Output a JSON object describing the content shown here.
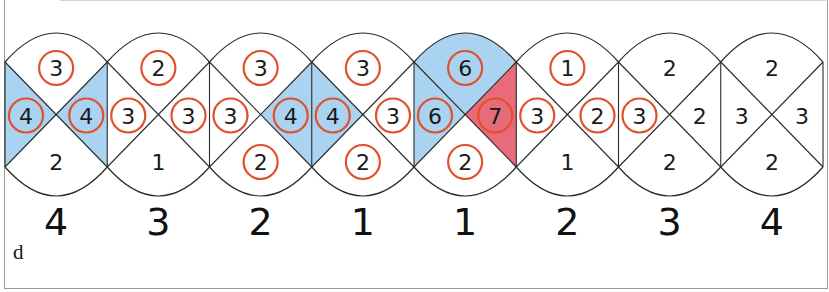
{
  "figure_label": "d",
  "colors": {
    "line": "#2a2a2a",
    "blue_fill": "#a9d3f0",
    "red_fill": "#e86b7a",
    "circle_stroke": "#e0502a",
    "text": "#1a1a1a"
  },
  "cells": [
    {
      "top": {
        "v": "3",
        "c": true
      },
      "left": {
        "v": "4",
        "c": true
      },
      "right": {
        "v": "4",
        "c": true
      },
      "bottom": {
        "v": "2",
        "c": false
      },
      "fill": {
        "left": "blue",
        "right": "blue"
      }
    },
    {
      "top": {
        "v": "2",
        "c": true
      },
      "left": {
        "v": "3",
        "c": true
      },
      "right": {
        "v": "3",
        "c": true
      },
      "bottom": {
        "v": "1",
        "c": false
      },
      "fill": {}
    },
    {
      "top": {
        "v": "3",
        "c": true
      },
      "left": {
        "v": "3",
        "c": true
      },
      "right": {
        "v": "4",
        "c": true
      },
      "bottom": {
        "v": "2",
        "c": true
      },
      "fill": {
        "right": "blue"
      }
    },
    {
      "top": {
        "v": "3",
        "c": true
      },
      "left": {
        "v": "4",
        "c": true
      },
      "right": {
        "v": "3",
        "c": true
      },
      "bottom": {
        "v": "2",
        "c": true
      },
      "fill": {
        "left": "blue"
      }
    },
    {
      "top": {
        "v": "6",
        "c": true
      },
      "left": {
        "v": "6",
        "c": true
      },
      "right": {
        "v": "7",
        "c": true
      },
      "bottom": {
        "v": "2",
        "c": true
      },
      "fill": {
        "top": "blue",
        "left": "blue",
        "right": "red"
      }
    },
    {
      "top": {
        "v": "1",
        "c": true
      },
      "left": {
        "v": "3",
        "c": true
      },
      "right": {
        "v": "2",
        "c": true
      },
      "bottom": {
        "v": "1",
        "c": false
      },
      "fill": {}
    },
    {
      "top": {
        "v": "2",
        "c": false
      },
      "left": {
        "v": "3",
        "c": true
      },
      "right": {
        "v": "2",
        "c": false
      },
      "bottom": {
        "v": "2",
        "c": false
      },
      "fill": {}
    },
    {
      "top": {
        "v": "2",
        "c": false
      },
      "left": {
        "v": "3",
        "c": false
      },
      "right": {
        "v": "3",
        "c": false
      },
      "bottom": {
        "v": "2",
        "c": false
      },
      "fill": {}
    }
  ],
  "bottom_numbers": [
    "4",
    "3",
    "2",
    "1",
    "1",
    "2",
    "3",
    "4"
  ]
}
